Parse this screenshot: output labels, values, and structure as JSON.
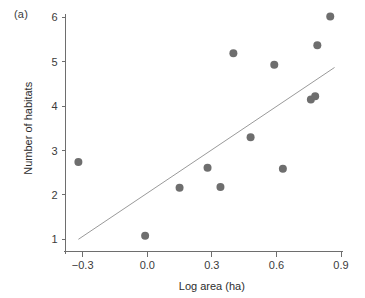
{
  "figure": {
    "panel_label": "(a)",
    "background_color": "#ffffff"
  },
  "chart_data": {
    "type": "scatter",
    "title": "",
    "xlabel": "Log area (ha)",
    "ylabel": "Number of habitats",
    "xlim": [
      -0.39,
      0.93
    ],
    "ylim": [
      0.6,
      6.15
    ],
    "xticks": [
      -0.3,
      0.0,
      0.3,
      0.6,
      0.9
    ],
    "xticklabels": [
      "−0.3",
      "0.0",
      "0.3",
      "0.6",
      "0.9"
    ],
    "yticks": [
      1,
      2,
      3,
      4,
      5,
      6
    ],
    "yticklabels": [
      "1",
      "2",
      "3",
      "4",
      "5",
      "6"
    ],
    "grid": false,
    "legend": null,
    "marker_color": "#6e6e6e",
    "marker_size": 8,
    "points": [
      {
        "x": -0.32,
        "y": 2.74
      },
      {
        "x": -0.01,
        "y": 1.08
      },
      {
        "x": 0.15,
        "y": 2.16
      },
      {
        "x": 0.28,
        "y": 2.61
      },
      {
        "x": 0.34,
        "y": 2.18
      },
      {
        "x": 0.4,
        "y": 5.19
      },
      {
        "x": 0.48,
        "y": 3.3
      },
      {
        "x": 0.59,
        "y": 4.93
      },
      {
        "x": 0.63,
        "y": 2.59
      },
      {
        "x": 0.76,
        "y": 4.15
      },
      {
        "x": 0.78,
        "y": 4.22
      },
      {
        "x": 0.79,
        "y": 5.37
      },
      {
        "x": 0.85,
        "y": 6.02
      }
    ],
    "fit_line": {
      "type": "linear-regression",
      "color": "#9a9a9a",
      "x_start": -0.32,
      "y_start": 1.0,
      "x_end": 0.87,
      "y_end": 4.87
    }
  }
}
